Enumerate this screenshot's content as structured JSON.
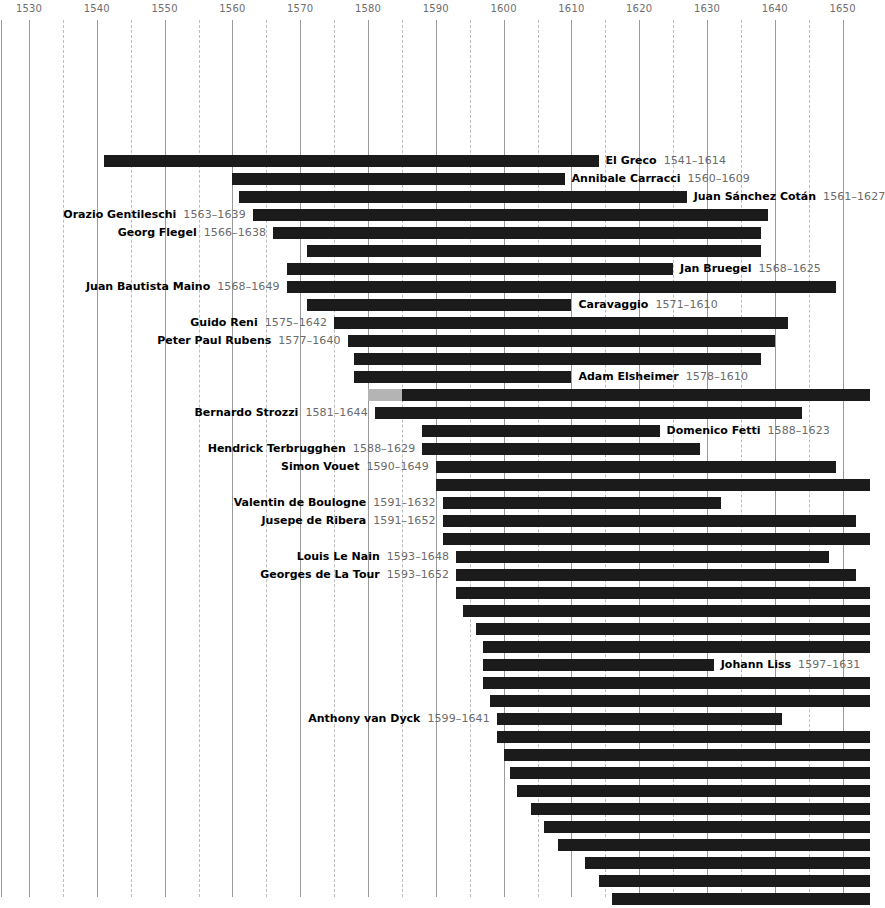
{
  "chart_data": {
    "type": "bar",
    "orientation": "horizontal",
    "subtype": "timeline-lifespan-gantt",
    "title": "",
    "subtitle": "",
    "xlabel": "",
    "ylabel": "",
    "xlim": [
      1527,
      1654
    ],
    "grid": true,
    "grid_major_step": 10,
    "grid_minor_step": 5,
    "legend": "none",
    "axis_position": "top",
    "tick_labels": [
      "1530",
      "1540",
      "1550",
      "1560",
      "1570",
      "1580",
      "1590",
      "1600",
      "1610",
      "1620",
      "1630",
      "1640",
      "1650"
    ],
    "ticks": [
      1530,
      1540,
      1550,
      1560,
      1570,
      1580,
      1590,
      1600,
      1610,
      1620,
      1630,
      1640,
      1650
    ],
    "minor_ticks": [
      1535,
      1545,
      1555,
      1565,
      1575,
      1585,
      1595,
      1605,
      1615,
      1625,
      1635,
      1645
    ],
    "bar_color": "#1b1b1b",
    "highlight_color": "#b4b4b4",
    "gridline_color": "#9a9a9a",
    "minor_gridline_color": "#bdbdbd",
    "tick_label_color": "#6e6e6e",
    "categories": [
      "El Greco",
      "Annibale Carracci",
      "Juan Sánchez Cotán",
      "Orazio Gentileschi",
      "Georg Flegel",
      "",
      "Jan Bruegel",
      "Juan Bautista Maino",
      "Caravaggio",
      "Guido Reni",
      "Peter Paul Rubens",
      "",
      "Adam Elsheimer",
      "",
      "Bernardo Strozzi",
      "Domenico Fetti",
      "Hendrick Terbrugghen",
      "Simon Vouet",
      "",
      "Valentin de Boulogne",
      "Jusepe de Ribera",
      "",
      "Louis Le Nain",
      "Georges de La Tour",
      "",
      "",
      "",
      "",
      "Johann Liss",
      "",
      "",
      "Anthony van Dyck",
      "",
      "",
      "",
      "",
      "",
      "",
      "",
      "",
      "",
      "",
      "",
      "",
      ""
    ],
    "rows": [
      {
        "y": 152,
        "name": "El Greco",
        "start": 1541,
        "end": 1614,
        "label": "El Greco",
        "years": "1541–1614",
        "label_side": "right-of-bar",
        "labeled": true
      },
      {
        "y": 170,
        "name": "Annibale Carracci",
        "start": 1560,
        "end": 1609,
        "label": "Annibale Carracci",
        "years": "1560–1609",
        "label_side": "right-of-bar",
        "labeled": true
      },
      {
        "y": 188,
        "name": "Juan Sánchez Cotán",
        "start": 1561,
        "end": 1627,
        "label": "Juan Sánchez Cotán",
        "years": "1561–1627",
        "label_side": "right-of-bar",
        "labeled": true
      },
      {
        "y": 206,
        "name": "Orazio Gentileschi",
        "start": 1563,
        "end": 1639,
        "label": "Orazio Gentileschi",
        "years": "1563–1639",
        "label_side": "left-of-bar",
        "labeled": true
      },
      {
        "y": 224,
        "name": "Georg Flegel",
        "start": 1566,
        "end": 1638,
        "label": "Georg Flegel",
        "years": "1566–1638",
        "label_side": "left-of-bar",
        "labeled": true
      },
      {
        "y": 242,
        "name": "",
        "start": 1571,
        "end": 1638,
        "label": "",
        "years": "",
        "label_side": "none",
        "labeled": false
      },
      {
        "y": 260,
        "name": "Jan Bruegel",
        "start": 1568,
        "end": 1625,
        "label": "Jan Bruegel",
        "years": "1568–1625",
        "label_side": "right-of-bar",
        "labeled": true
      },
      {
        "y": 278,
        "name": "Juan Bautista Maino",
        "start": 1568,
        "end": 1649,
        "label": "Juan Bautista Maino",
        "years": "1568–1649",
        "label_side": "left-of-bar",
        "labeled": true
      },
      {
        "y": 296,
        "name": "Caravaggio",
        "start": 1571,
        "end": 1610,
        "label": "Caravaggio",
        "years": "1571–1610",
        "label_side": "right-of-bar",
        "labeled": true
      },
      {
        "y": 314,
        "name": "Guido Reni",
        "start": 1575,
        "end": 1642,
        "label": "Guido Reni",
        "years": "1575–1642",
        "label_side": "left-of-bar",
        "labeled": true
      },
      {
        "y": 332,
        "name": "Peter Paul Rubens",
        "start": 1577,
        "end": 1640,
        "label": "Peter Paul Rubens",
        "years": "1577–1640",
        "label_side": "left-of-bar",
        "labeled": true
      },
      {
        "y": 350,
        "name": "",
        "start": 1578,
        "end": 1638,
        "label": "",
        "years": "",
        "label_side": "none",
        "labeled": false
      },
      {
        "y": 368,
        "name": "Adam Elsheimer",
        "start": 1578,
        "end": 1610,
        "label": "Adam Elsheimer",
        "years": "1578–1610",
        "label_side": "right-of-bar",
        "labeled": true
      },
      {
        "y": 386,
        "name": "",
        "start": 1580,
        "end": 1654,
        "label": "",
        "years": "",
        "label_side": "none",
        "labeled": false,
        "highlight_until": 1585
      },
      {
        "y": 404,
        "name": "Bernardo Strozzi",
        "start": 1581,
        "end": 1644,
        "label": "Bernardo Strozzi",
        "years": "1581–1644",
        "label_side": "left-of-bar",
        "labeled": true
      },
      {
        "y": 422,
        "name": "Domenico Fetti",
        "start": 1588,
        "end": 1623,
        "label": "Domenico Fetti",
        "years": "1588–1623",
        "label_side": "right-of-bar",
        "labeled": true
      },
      {
        "y": 440,
        "name": "Hendrick Terbrugghen",
        "start": 1588,
        "end": 1629,
        "label": "Hendrick Terbrugghen",
        "years": "1588–1629",
        "label_side": "left-of-bar",
        "labeled": true
      },
      {
        "y": 458,
        "name": "Simon Vouet",
        "start": 1590,
        "end": 1649,
        "label": "Simon Vouet",
        "years": "1590–1649",
        "label_side": "left-of-bar",
        "labeled": true
      },
      {
        "y": 476,
        "name": "",
        "start": 1590,
        "end": 1654,
        "label": "",
        "years": "",
        "label_side": "none",
        "labeled": false
      },
      {
        "y": 494,
        "name": "Valentin de Boulogne",
        "start": 1591,
        "end": 1632,
        "label": "Valentin de Boulogne",
        "years": "1591–1632",
        "label_side": "left-of-bar",
        "labeled": true
      },
      {
        "y": 512,
        "name": "Jusepe de Ribera",
        "start": 1591,
        "end": 1652,
        "label": "Jusepe de Ribera",
        "years": "1591–1652",
        "label_side": "left-of-bar",
        "labeled": true
      },
      {
        "y": 530,
        "name": "",
        "start": 1591,
        "end": 1654,
        "label": "",
        "years": "",
        "label_side": "none",
        "labeled": false
      },
      {
        "y": 548,
        "name": "Louis Le Nain",
        "start": 1593,
        "end": 1648,
        "label": "Louis Le Nain",
        "years": "1593–1648",
        "label_side": "left-of-bar",
        "labeled": true
      },
      {
        "y": 566,
        "name": "Georges de La Tour",
        "start": 1593,
        "end": 1652,
        "label": "Georges de La Tour",
        "years": "1593–1652",
        "label_side": "left-of-bar",
        "labeled": true
      },
      {
        "y": 584,
        "name": "",
        "start": 1593,
        "end": 1654,
        "label": "",
        "years": "",
        "label_side": "none",
        "labeled": false
      },
      {
        "y": 602,
        "name": "",
        "start": 1594,
        "end": 1654,
        "label": "",
        "years": "",
        "label_side": "none",
        "labeled": false
      },
      {
        "y": 620,
        "name": "",
        "start": 1596,
        "end": 1654,
        "label": "",
        "years": "",
        "label_side": "none",
        "labeled": false
      },
      {
        "y": 638,
        "name": "",
        "start": 1597,
        "end": 1654,
        "label": "",
        "years": "",
        "label_side": "none",
        "labeled": false
      },
      {
        "y": 656,
        "name": "Johann Liss",
        "start": 1597,
        "end": 1631,
        "label": "Johann Liss",
        "years": "1597–1631",
        "label_side": "right-of-bar",
        "labeled": true
      },
      {
        "y": 674,
        "name": "",
        "start": 1597,
        "end": 1654,
        "label": "",
        "years": "",
        "label_side": "none",
        "labeled": false
      },
      {
        "y": 692,
        "name": "",
        "start": 1598,
        "end": 1654,
        "label": "",
        "years": "",
        "label_side": "none",
        "labeled": false
      },
      {
        "y": 710,
        "name": "Anthony van Dyck",
        "start": 1599,
        "end": 1641,
        "label": "Anthony van Dyck",
        "years": "1599–1641",
        "label_side": "left-of-bar",
        "labeled": true
      },
      {
        "y": 728,
        "name": "",
        "start": 1599,
        "end": 1654,
        "label": "",
        "years": "",
        "label_side": "none",
        "labeled": false
      },
      {
        "y": 746,
        "name": "",
        "start": 1600,
        "end": 1654,
        "label": "",
        "years": "",
        "label_side": "none",
        "labeled": false
      },
      {
        "y": 764,
        "name": "",
        "start": 1601,
        "end": 1654,
        "label": "",
        "years": "",
        "label_side": "none",
        "labeled": false
      },
      {
        "y": 782,
        "name": "",
        "start": 1602,
        "end": 1654,
        "label": "",
        "years": "",
        "label_side": "none",
        "labeled": false
      },
      {
        "y": 800,
        "name": "",
        "start": 1604,
        "end": 1654,
        "label": "",
        "years": "",
        "label_side": "none",
        "labeled": false
      },
      {
        "y": 818,
        "name": "",
        "start": 1606,
        "end": 1654,
        "label": "",
        "years": "",
        "label_side": "none",
        "labeled": false
      },
      {
        "y": 836,
        "name": "",
        "start": 1608,
        "end": 1654,
        "label": "",
        "years": "",
        "label_side": "none",
        "labeled": false
      },
      {
        "y": 854,
        "name": "",
        "start": 1612,
        "end": 1654,
        "label": "",
        "years": "",
        "label_side": "none",
        "labeled": false
      },
      {
        "y": 872,
        "name": "",
        "start": 1614,
        "end": 1654,
        "label": "",
        "years": "",
        "label_side": "none",
        "labeled": false
      },
      {
        "y": 890,
        "name": "",
        "start": 1616,
        "end": 1654,
        "label": "",
        "years": "",
        "label_side": "none",
        "labeled": false
      }
    ]
  }
}
